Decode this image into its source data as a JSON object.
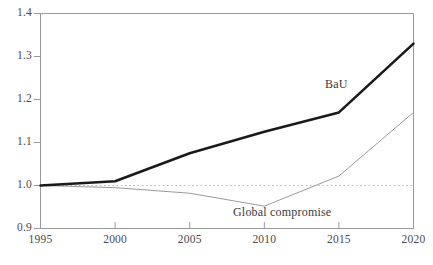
{
  "chart_data": {
    "type": "line",
    "title": "",
    "xlabel": "",
    "ylabel": "",
    "x": [
      1995,
      2000,
      2005,
      2010,
      2015,
      2020
    ],
    "categories": [
      "1995",
      "2000",
      "2005",
      "2010",
      "2015",
      "2020"
    ],
    "xlim": [
      1995,
      2020
    ],
    "ylim": [
      0.9,
      1.4
    ],
    "y_ticks": [
      "0.9",
      "1.0",
      "1.1",
      "1.2",
      "1.3",
      "1.4"
    ],
    "y_tick_values": [
      0.9,
      1.0,
      1.1,
      1.2,
      1.3,
      1.4
    ],
    "x_ticks": [
      "1995",
      "2000",
      "2005",
      "2010",
      "2015",
      "2020"
    ],
    "grid": false,
    "legend": "inline-annotations",
    "series": [
      {
        "name": "BaU",
        "label": "BaU",
        "color": "#1a1a1a",
        "width": 2.6,
        "style": "solid",
        "values": [
          1.0,
          1.01,
          1.075,
          1.125,
          1.17,
          1.33
        ]
      },
      {
        "name": "Global compromise",
        "label": "Global compromise",
        "color": "#9a9a9a",
        "width": 1.0,
        "style": "solid",
        "values": [
          1.0,
          0.995,
          0.982,
          0.952,
          1.022,
          1.17
        ]
      }
    ],
    "reference_line": {
      "name": "baseline-1.0",
      "value": 1.0,
      "style": "dotted",
      "color": "#b9b9b9"
    },
    "annotations": [
      {
        "text": "BaU",
        "x": 2015,
        "y": 1.245
      },
      {
        "text": "Global compromise",
        "x": 2012,
        "y": 0.935
      }
    ],
    "axis_color": "#9a9a9a"
  }
}
